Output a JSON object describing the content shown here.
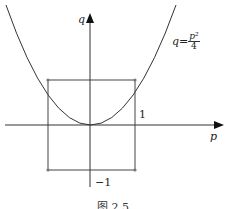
{
  "axes": {
    "x_label": "p",
    "y_label": "q"
  },
  "curve": {
    "label_lhs": "q=",
    "label_num": "p²",
    "label_den": "4",
    "equation": "q = p^2/4"
  },
  "ticks": {
    "upper": "1",
    "lower": "−1"
  },
  "box": {
    "p_range": [
      -2,
      2
    ],
    "q_range": [
      -1,
      1
    ]
  },
  "caption": "图 2.5",
  "colors": {
    "line": "#333333",
    "dot": "#777777"
  }
}
